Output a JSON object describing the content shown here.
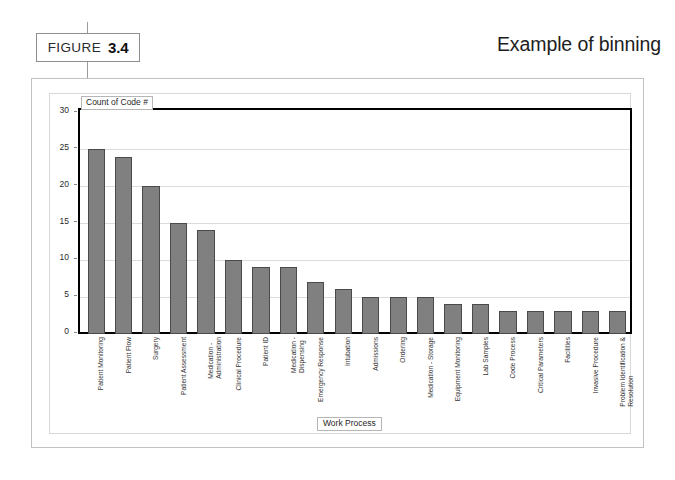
{
  "figure": {
    "label": "FIGURE",
    "number": "3.4",
    "title": "Example of binning"
  },
  "chart_data": {
    "type": "bar",
    "title": "Count of Code #",
    "legend_label": "Count of Code #",
    "xlabel": "Work Process",
    "ylabel": "",
    "ylim": [
      0,
      30
    ],
    "yticks": [
      0,
      5,
      10,
      15,
      20,
      25,
      30
    ],
    "ytick_labels": [
      "0",
      "5",
      "10",
      "15",
      "20",
      "25",
      "30"
    ],
    "grid": true,
    "legend_position": "top-left-inside",
    "bar_color": "#808080",
    "bar_edge_color": "#4a4a4a",
    "categories": [
      "Patient Monitoring",
      "Patient Flow",
      "Surgery",
      "Patient Assessment",
      "Medication - Administration",
      "Clinical Procedure",
      "Patient ID",
      "Medication - Dispensing",
      "Emergency Response",
      "Intubation",
      "Admissions",
      "Ordering",
      "Medication - Storage",
      "Equipment Monitoring",
      "Lab Samples",
      "Code Process",
      "Critical Parameters",
      "Facilities",
      "Invasive Procedure",
      "Problem Identification & Resolution"
    ],
    "category_lines": [
      [
        "Patient Monitoring"
      ],
      [
        "Patient Flow"
      ],
      [
        "Surgery"
      ],
      [
        "Patient Assessment"
      ],
      [
        "Medication -",
        "Administration"
      ],
      [
        "Clinical Procedure"
      ],
      [
        "Patient ID"
      ],
      [
        "Medication -",
        "Dispensing"
      ],
      [
        "Emergency Response"
      ],
      [
        "Intubation"
      ],
      [
        "Admissions"
      ],
      [
        "Ordering"
      ],
      [
        "Medication - Storage"
      ],
      [
        "Equipment Monitoring"
      ],
      [
        "Lab Samples"
      ],
      [
        "Code Process"
      ],
      [
        "Critical Parameters"
      ],
      [
        "Facilities"
      ],
      [
        "Invasive Procedure"
      ],
      [
        "Problem Identification &",
        "Resolution"
      ]
    ],
    "values": [
      25,
      24,
      20,
      15,
      14,
      10,
      9,
      9,
      7,
      6,
      5,
      5,
      5,
      4,
      4,
      3,
      3,
      3,
      3,
      3
    ]
  }
}
